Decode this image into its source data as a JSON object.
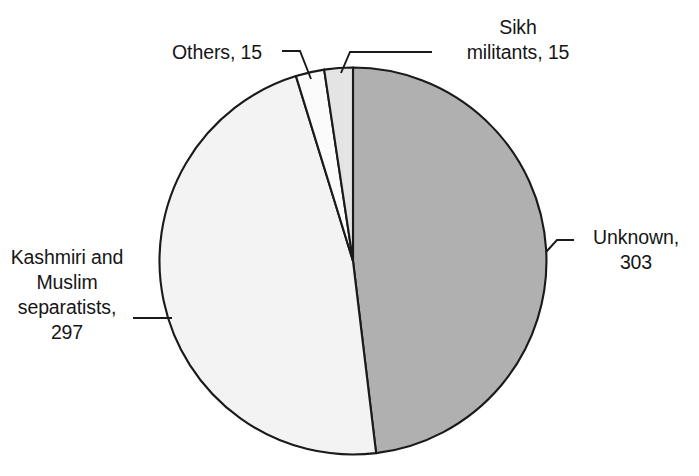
{
  "chart_data": {
    "type": "pie",
    "title": "",
    "subtitle": "",
    "xlabel": "",
    "ylabel": "",
    "legend_position": "none",
    "grid": false,
    "total": 630,
    "categories": [
      "Unknown",
      "Kashmiri and Muslim separatists",
      "Others",
      "Sikh militants"
    ],
    "values": [
      303,
      297,
      15,
      15
    ],
    "slices": [
      {
        "name": "unknown",
        "label_text": "Unknown,\n303",
        "category": "Unknown",
        "value": 303,
        "percent": 48.1,
        "start_angle": 0,
        "end_angle": 173.14,
        "color": "#b0b0b0",
        "edge_color": "#1a1a1a"
      },
      {
        "name": "kashmiri-muslim-separatists",
        "label_text": "Kashmiri and\nMuslim\nseparatists,\n297",
        "category": "Kashmiri and Muslim separatists",
        "value": 297,
        "percent": 47.1,
        "start_angle": 173.14,
        "end_angle": 342.86,
        "color": "#f3f3f3",
        "edge_color": "#1a1a1a"
      },
      {
        "name": "others",
        "label_text": "Others, 15",
        "category": "Others",
        "value": 15,
        "percent": 2.4,
        "start_angle": 342.86,
        "end_angle": 351.43,
        "color": "#fbfbfb",
        "edge_color": "#1a1a1a"
      },
      {
        "name": "sikh-militants",
        "label_text": "Sikh\nmilitants, 15",
        "category": "Sikh militants",
        "value": 15,
        "percent": 2.4,
        "start_angle": 351.43,
        "end_angle": 360,
        "color": "#e4e4e4",
        "edge_color": "#1a1a1a"
      }
    ]
  },
  "labels": {
    "others": "Others, 15",
    "sikh": "Sikh\nmilitants, 15",
    "unknown": "Unknown,\n303",
    "kashmiri": "Kashmiri and\nMuslim\nseparatists,\n297"
  },
  "colors": {
    "background": "#ffffff",
    "outline": "#1a1a1a",
    "text": "#161616",
    "unknown_slice": "#b0b0b0",
    "kashmiri_slice": "#f3f3f3",
    "others_slice": "#fbfbfb",
    "sikh_slice": "#e4e4e4"
  }
}
